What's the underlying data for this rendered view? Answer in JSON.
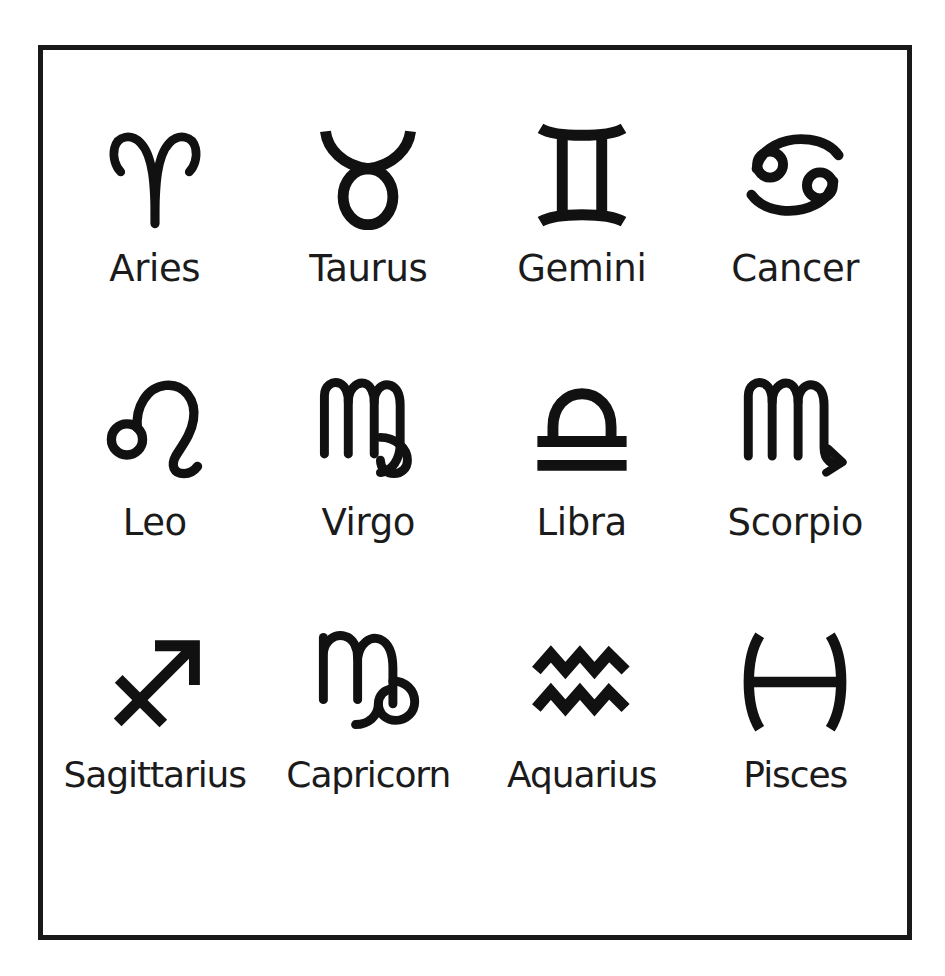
{
  "page": {
    "background_color": "#ffffff",
    "top_sliver_text": "",
    "frame": {
      "border_color": "#191919",
      "border_width_px": 5,
      "fill_color": "#ffffff"
    }
  },
  "chart": {
    "title": "",
    "symbol_color": "#111111",
    "label_color": "#1b1b1b",
    "columns": 4,
    "rows": 3
  },
  "signs": [
    {
      "name": "Aries",
      "symbol": "♈",
      "icon": "aries-symbol",
      "row": 1,
      "column": 1
    },
    {
      "name": "Taurus",
      "symbol": "♉",
      "icon": "taurus-symbol",
      "row": 1,
      "column": 2
    },
    {
      "name": "Gemini",
      "symbol": "♊",
      "icon": "gemini-symbol",
      "row": 1,
      "column": 3
    },
    {
      "name": "Cancer",
      "symbol": "♋",
      "icon": "cancer-symbol",
      "row": 1,
      "column": 4
    },
    {
      "name": "Leo",
      "symbol": "♌",
      "icon": "leo-symbol",
      "row": 2,
      "column": 1
    },
    {
      "name": "Virgo",
      "symbol": "♍",
      "icon": "virgo-symbol",
      "row": 2,
      "column": 2
    },
    {
      "name": "Libra",
      "symbol": "♎",
      "icon": "libra-symbol",
      "row": 2,
      "column": 3
    },
    {
      "name": "Scorpio",
      "symbol": "♏",
      "icon": "scorpio-symbol",
      "row": 2,
      "column": 4
    },
    {
      "name": "Sagittarius",
      "symbol": "♐",
      "icon": "sagittarius-symbol",
      "row": 3,
      "column": 1
    },
    {
      "name": "Capricorn",
      "symbol": "♑",
      "icon": "capricorn-symbol",
      "row": 3,
      "column": 2
    },
    {
      "name": "Aquarius",
      "symbol": "♒",
      "icon": "aquarius-symbol",
      "row": 3,
      "column": 3
    },
    {
      "name": "Pisces",
      "symbol": "♓",
      "icon": "pisces-symbol",
      "row": 3,
      "column": 4
    }
  ]
}
